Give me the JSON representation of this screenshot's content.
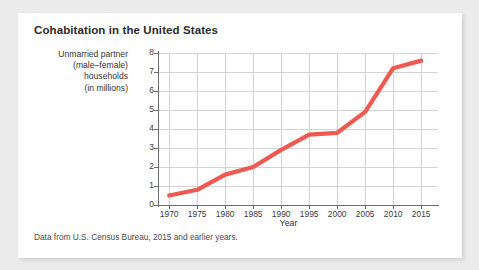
{
  "card": {
    "title": "Cohabitation in the United States",
    "source_note": "Data from U.S. Census Bureau, 2015 and earlier years."
  },
  "colors": {
    "line": "#ee5a52",
    "grid": "#d3d3d5",
    "axis": "#6d6d70",
    "card_background": "#ffffff",
    "page_background": "#ececed",
    "title_text": "#2a2a2a"
  },
  "axis_label_lines": {
    "y": [
      "Unmarried partner",
      "(male–female)",
      "households",
      "(in millions)"
    ],
    "x": "Year"
  },
  "chart_data": {
    "type": "line",
    "title": "Cohabitation in the United States",
    "xlabel": "Year",
    "ylabel": "Unmarried partner (male–female) households (in millions)",
    "x": [
      1970,
      1975,
      1980,
      1985,
      1990,
      1995,
      2000,
      2005,
      2010,
      2015
    ],
    "values": [
      0.5,
      0.8,
      1.6,
      2.0,
      2.9,
      3.7,
      3.8,
      4.9,
      7.2,
      7.6
    ],
    "xtick_labels": [
      "1970",
      "1975",
      "1980",
      "1985",
      "1990",
      "1995",
      "2000",
      "2005",
      "2010",
      "2015"
    ],
    "ytick_labels": [
      "0",
      "1",
      "2",
      "3",
      "4",
      "5",
      "6",
      "7",
      "8"
    ],
    "yticks": [
      0,
      1,
      2,
      3,
      4,
      5,
      6,
      7,
      8
    ],
    "xlim": [
      1968,
      2018
    ],
    "ylim": [
      0,
      8
    ],
    "grid": true,
    "legend": "none",
    "series_name": "Unmarried partner (male-female) households"
  }
}
